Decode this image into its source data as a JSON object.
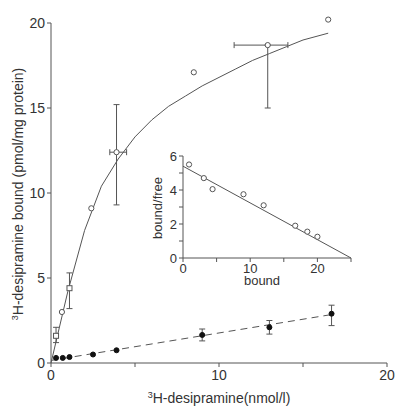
{
  "chart_data": [
    {
      "type": "scatter",
      "title": "",
      "xlabel": "3H-desipramine(nmol/l)",
      "xlabel_sup": "3",
      "xlabel_rest": "H-desipramine(nmol/l)",
      "ylabel": "3H-desipramine bound (pmol/mg protein)",
      "ylabel_sup": "3",
      "ylabel_rest": "H-desipramine bound (pmol/mg protein)",
      "xlim": [
        0,
        20
      ],
      "ylim": [
        0,
        20
      ],
      "xticks": [
        0,
        5,
        10,
        15,
        20
      ],
      "xtick_labels": [
        "0",
        "",
        "10",
        "",
        "20"
      ],
      "yticks": [
        0,
        5,
        10,
        15,
        20
      ],
      "ytick_labels": [
        "0",
        "5",
        "10",
        "15",
        "20"
      ],
      "grid": false,
      "series": [
        {
          "name": "total binding",
          "marker": "open-circle",
          "line": "solid-fit",
          "points": [
            {
              "x": 0.3,
              "y": 1.6,
              "marker": "open-square",
              "yerr": [
                1.2,
                2.1
              ]
            },
            {
              "x": 0.65,
              "y": 3.0
            },
            {
              "x": 1.1,
              "y": 4.4,
              "marker": "open-square",
              "yerr": [
                3.2,
                5.3
              ]
            },
            {
              "x": 2.4,
              "y": 9.1
            },
            {
              "x": 3.9,
              "y": 12.4,
              "yerr": [
                9.3,
                15.2
              ],
              "xerr": [
                3.5,
                4.5
              ]
            },
            {
              "x": 8.5,
              "y": 17.1
            },
            {
              "x": 12.9,
              "y": 18.7,
              "yerr": [
                15.0,
                18.7
              ],
              "xerr": [
                10.9,
                14.1
              ]
            },
            {
              "x": 16.5,
              "y": 20.2
            }
          ],
          "fit_curve": [
            [
              0,
              0
            ],
            [
              1.0,
              4.2
            ],
            [
              2.0,
              7.8
            ],
            [
              3.0,
              10.4
            ],
            [
              4.0,
              12.0
            ],
            [
              5.0,
              13.3
            ],
            [
              6.0,
              14.3
            ],
            [
              7.0,
              15.1
            ],
            [
              8.0,
              15.7
            ],
            [
              9.0,
              16.3
            ],
            [
              10.0,
              16.8
            ],
            [
              11.0,
              17.3
            ],
            [
              12.0,
              17.8
            ],
            [
              13.0,
              18.2
            ],
            [
              14.0,
              18.6
            ],
            [
              15.0,
              19.0
            ],
            [
              16.5,
              19.4
            ]
          ]
        },
        {
          "name": "nonspecific binding",
          "marker": "filled-circle",
          "line": "dashed-linear",
          "points": [
            {
              "x": 0.3,
              "y": 0.3
            },
            {
              "x": 0.7,
              "y": 0.3
            },
            {
              "x": 1.1,
              "y": 0.35
            },
            {
              "x": 2.5,
              "y": 0.5
            },
            {
              "x": 3.9,
              "y": 0.75
            },
            {
              "x": 9.0,
              "y": 1.65,
              "yerr": [
                1.3,
                2.0
              ]
            },
            {
              "x": 13.0,
              "y": 2.1,
              "yerr": [
                1.7,
                2.5
              ]
            },
            {
              "x": 16.7,
              "y": 2.9,
              "yerr": [
                2.2,
                3.4
              ]
            }
          ],
          "fit_line": [
            [
              0,
              0.15
            ],
            [
              16.7,
              2.85
            ]
          ]
        }
      ]
    },
    {
      "type": "scatter",
      "title": "Scatchard plot (inset)",
      "xlabel": "bound",
      "ylabel": "bound/free",
      "xlim": [
        0,
        25
      ],
      "ylim": [
        0,
        6
      ],
      "xticks": [
        0,
        5,
        10,
        15,
        20,
        25
      ],
      "xtick_labels": [
        "0",
        "",
        "10",
        "",
        "20",
        ""
      ],
      "yticks": [
        0,
        1,
        2,
        3,
        4,
        5,
        6
      ],
      "ytick_labels": [
        "0",
        "",
        "2",
        "",
        "4",
        "",
        "6"
      ],
      "grid": false,
      "series": [
        {
          "name": "scatchard",
          "marker": "open-circle",
          "points": [
            {
              "x": 0.9,
              "y": 5.5
            },
            {
              "x": 3.1,
              "y": 4.7
            },
            {
              "x": 4.4,
              "y": 4.05
            },
            {
              "x": 9.0,
              "y": 3.75
            },
            {
              "x": 12.0,
              "y": 3.1
            },
            {
              "x": 16.7,
              "y": 1.9
            },
            {
              "x": 18.5,
              "y": 1.55
            },
            {
              "x": 20.0,
              "y": 1.25
            }
          ],
          "fit_line": [
            [
              0,
              5.4
            ],
            [
              25,
              0
            ]
          ]
        }
      ]
    }
  ]
}
